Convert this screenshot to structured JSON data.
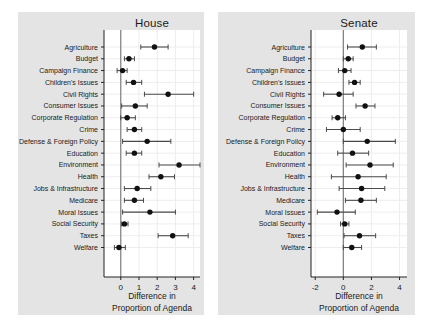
{
  "colors": {
    "panel_bg": "#e4e4e4",
    "plot_bg": "#ffffff",
    "grid": "#ededed",
    "zero_line": "#7e7e7e",
    "axis": "#222222",
    "marker": "#111111",
    "error_bar": "#4a4a4a",
    "text": "#1a1a1a"
  },
  "chart_data": [
    {
      "type": "scatter",
      "title": "House",
      "xlabel_lines": [
        "Difference in",
        "Proportion of Agenda"
      ],
      "xlim": [
        -0.92,
        4.35
      ],
      "xticks": [
        0,
        1,
        2,
        3,
        4
      ],
      "grid": true,
      "categories": [
        "Agriculture",
        "Budget",
        "Campaign Finance",
        "Children's Issues",
        "Civil Rights",
        "Consumer Issues",
        "Corporate Regulation",
        "Crime",
        "Defense & Foreign Policy",
        "Education",
        "Environment",
        "Health",
        "Jobs & Infrastructure",
        "Medicare",
        "Moral Issues",
        "Social Security",
        "Taxes",
        "Welfare"
      ],
      "series": [
        {
          "name": "difference_in_proportion_of_agenda",
          "values": [
            1.85,
            0.45,
            0.1,
            0.7,
            2.6,
            0.8,
            0.35,
            0.75,
            1.45,
            0.75,
            3.2,
            2.2,
            0.9,
            0.75,
            1.6,
            0.2,
            2.85,
            -0.1
          ],
          "ci_low": [
            1.1,
            0.2,
            -0.2,
            0.3,
            1.3,
            0.05,
            0.0,
            0.35,
            0.1,
            0.3,
            2.1,
            1.55,
            0.2,
            0.2,
            0.1,
            0.05,
            2.05,
            -0.35
          ],
          "ci_high": [
            2.6,
            0.75,
            0.35,
            1.15,
            4.0,
            1.45,
            0.8,
            1.15,
            2.75,
            1.15,
            4.35,
            2.95,
            1.65,
            1.25,
            3.0,
            0.4,
            3.7,
            0.25
          ]
        }
      ]
    },
    {
      "type": "scatter",
      "title": "Senate",
      "xlabel_lines": [
        "Difference in",
        "Proportion of Agenda"
      ],
      "xlim": [
        -2.3,
        4.53
      ],
      "xticks": [
        -2,
        0,
        2,
        4
      ],
      "grid": true,
      "categories": [
        "Agriculture",
        "Budget",
        "Campaign Finance",
        "Children's Issues",
        "Civil Rights",
        "Consumer Issues",
        "Corporate Regulation",
        "Crime",
        "Defense & Foreign Policy",
        "Education",
        "Environment",
        "Health",
        "Jobs & Infrastructure",
        "Medicare",
        "Moral Issues",
        "Social Security",
        "Taxes",
        "Welfare"
      ],
      "series": [
        {
          "name": "difference_in_proportion_of_agenda",
          "values": [
            1.35,
            0.35,
            0.1,
            0.8,
            -0.3,
            1.55,
            -0.4,
            0.0,
            1.7,
            0.65,
            1.9,
            1.05,
            1.3,
            1.25,
            -0.45,
            0.1,
            1.15,
            0.6
          ],
          "ci_low": [
            0.3,
            0.0,
            -0.35,
            0.4,
            -1.4,
            0.9,
            -0.8,
            -1.2,
            0.0,
            -0.4,
            0.2,
            -0.85,
            -0.3,
            0.15,
            -1.85,
            -0.2,
            0.05,
            0.0
          ],
          "ci_high": [
            2.35,
            0.7,
            0.55,
            1.2,
            0.7,
            2.25,
            0.15,
            1.2,
            3.7,
            1.8,
            3.55,
            3.05,
            2.95,
            2.35,
            0.85,
            0.4,
            2.3,
            1.3
          ]
        }
      ]
    }
  ]
}
